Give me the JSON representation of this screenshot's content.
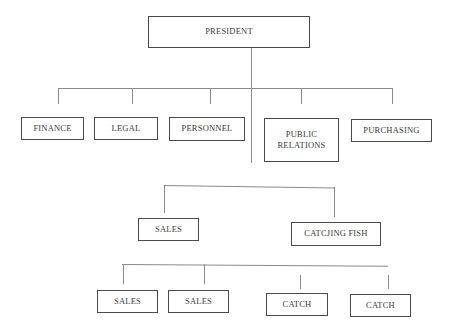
{
  "chart": {
    "type": "org-chart",
    "root": "PRESIDENT",
    "departments": [
      "FINANCE",
      "LEGAL",
      "PERSONNEL",
      "PUBLIC RELATIONS",
      "PURCHASING"
    ],
    "level2": [
      "SALES",
      "CATCJING FISH"
    ],
    "level3": [
      "SALES",
      "SALES",
      "CATCH",
      "CATCH"
    ]
  },
  "nodes": {
    "president": "PRESIDENT",
    "finance": "FINANCE",
    "legal": "LEGAL",
    "personnel": "PERSONNEL",
    "public_relations_1": "PUBLIC",
    "public_relations_2": "RELATIONS",
    "purchasing": "PURCHASING",
    "sales": "SALES",
    "catching_fish": "CATCJING FISH",
    "sales_a": "SALES",
    "sales_b": "SALES",
    "catch_a": "CATCH",
    "catch_b": "CATCH"
  }
}
